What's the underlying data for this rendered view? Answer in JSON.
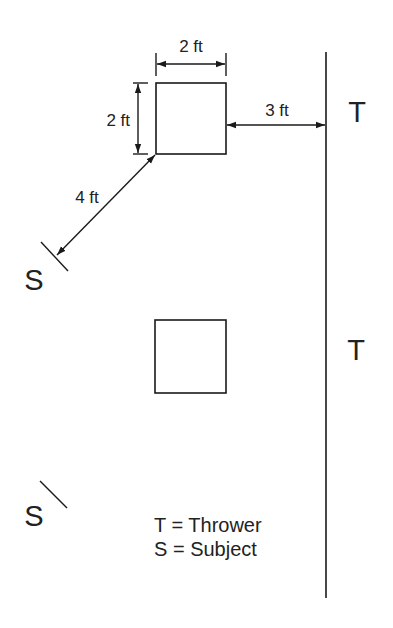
{
  "diagram": {
    "colors": {
      "line": "#1a1a1a",
      "text": "#222222",
      "background": "#ffffff"
    },
    "dimensions": {
      "box_width": "2 ft",
      "box_height": "2 ft",
      "box_to_thrower_line": "3 ft",
      "box_to_subject": "4 ft"
    },
    "markers": {
      "thrower_top": "T",
      "thrower_bottom": "T",
      "subject_top": "S",
      "subject_bottom": "S"
    },
    "legend": {
      "thrower": "T = Thrower",
      "subject": "S = Subject"
    },
    "elements": [
      {
        "type": "box",
        "label": "top box (2 ft × 2 ft)"
      },
      {
        "type": "box",
        "label": "bottom box"
      },
      {
        "type": "line",
        "label": "thrower line (vertical)"
      }
    ]
  }
}
